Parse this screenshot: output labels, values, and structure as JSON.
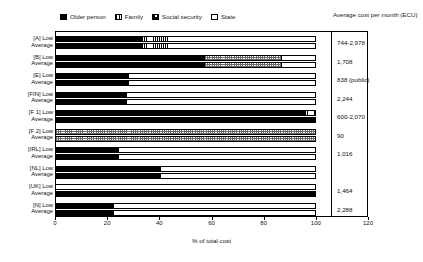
{
  "legend": {
    "items": [
      {
        "label": "Older person",
        "pattern": "solid-black",
        "color": "#000000"
      },
      {
        "label": "Family",
        "pattern": "vertical-stripes",
        "color": "#000000"
      },
      {
        "label": "Social security",
        "pattern": "checkered",
        "color": "#6a6a6a"
      },
      {
        "label": "State",
        "pattern": "white",
        "color": "#ffffff"
      }
    ]
  },
  "right_header": "Average cost per month (ECU)",
  "chart_data": {
    "type": "bar",
    "orientation": "horizontal",
    "stacked": true,
    "title": "",
    "xlabel": "% of total cost",
    "ylabel": "",
    "xlim": [
      0,
      120
    ],
    "xticks": [
      0,
      20,
      40,
      60,
      80,
      100,
      120
    ],
    "grid": false,
    "legend_position": "top",
    "series": [
      {
        "name": "Older person",
        "pattern": "solid-black"
      },
      {
        "name": "Family",
        "pattern": "vertical-stripes"
      },
      {
        "name": "Social security",
        "pattern": "checkered"
      },
      {
        "name": "State",
        "pattern": "white"
      }
    ],
    "groups": [
      {
        "country": "[A]",
        "label_line1": "[A] Low",
        "label_line2": "Average",
        "cost": "744-2,978",
        "bars": [
          {
            "row": "Low",
            "segments": [
              {
                "series": "Older person",
                "value": 33
              },
              {
                "series": "Family",
                "value": 10
              },
              {
                "series": "State",
                "value": 57
              }
            ]
          },
          {
            "row": "Average",
            "segments": [
              {
                "series": "Older person",
                "value": 33
              },
              {
                "series": "Family",
                "value": 10
              },
              {
                "series": "State",
                "value": 57
              }
            ]
          }
        ]
      },
      {
        "country": "[B]",
        "label_line1": "[B] Low",
        "label_line2": "Average",
        "cost": "1,708",
        "bars": [
          {
            "row": "Low",
            "segments": [
              {
                "series": "Older person",
                "value": 57
              },
              {
                "series": "Social security",
                "value": 30
              },
              {
                "series": "State",
                "value": 13
              }
            ]
          },
          {
            "row": "Average",
            "segments": [
              {
                "series": "Older person",
                "value": 57
              },
              {
                "series": "Social security",
                "value": 30
              },
              {
                "series": "State",
                "value": 13
              }
            ]
          }
        ]
      },
      {
        "country": "[E]",
        "label_line1": "[E] Low",
        "label_line2": "Average",
        "cost": "838 (public)",
        "bars": [
          {
            "row": "Low",
            "segments": [
              {
                "series": "Older person",
                "value": 28
              },
              {
                "series": "State",
                "value": 72
              }
            ]
          },
          {
            "row": "Average",
            "segments": [
              {
                "series": "Older person",
                "value": 28
              },
              {
                "series": "State",
                "value": 72
              }
            ]
          }
        ]
      },
      {
        "country": "[FIN]",
        "label_line1": "[FIN] Low",
        "label_line2": "Average",
        "cost": "2,244",
        "bars": [
          {
            "row": "Low",
            "segments": [
              {
                "series": "Older person",
                "value": 27
              },
              {
                "series": "State",
                "value": 73
              }
            ]
          },
          {
            "row": "Average",
            "segments": [
              {
                "series": "Older person",
                "value": 27
              },
              {
                "series": "State",
                "value": 73
              }
            ]
          }
        ]
      },
      {
        "country": "[F 1]",
        "label_line1": "[F 1] Low",
        "label_line2": "Average",
        "cost": "600-2,070",
        "bars": [
          {
            "row": "Low",
            "segments": [
              {
                "series": "Older person",
                "value": 96
              },
              {
                "series": "Family",
                "value": 4
              }
            ]
          },
          {
            "row": "Average",
            "segments": [
              {
                "series": "Older person",
                "value": 100
              }
            ]
          }
        ]
      },
      {
        "country": "[F 2]",
        "label_line1": "[F 2] Low",
        "label_line2": "Average",
        "cost": "90",
        "bars": [
          {
            "row": "Low",
            "segments": [
              {
                "series": "Social security",
                "value": 100
              }
            ]
          },
          {
            "row": "Average",
            "segments": [
              {
                "series": "Social security",
                "value": 100
              }
            ]
          }
        ]
      },
      {
        "country": "[IRL]",
        "label_line1": "[IRL] Low",
        "label_line2": "Average",
        "cost": "1,016",
        "bars": [
          {
            "row": "Low",
            "segments": [
              {
                "series": "Older person",
                "value": 24
              },
              {
                "series": "State",
                "value": 76
              }
            ]
          },
          {
            "row": "Average",
            "segments": [
              {
                "series": "Older person",
                "value": 24
              },
              {
                "series": "State",
                "value": 76
              }
            ]
          }
        ]
      },
      {
        "country": "[NL]",
        "label_line1": "[NL] Low",
        "label_line2": "Average",
        "cost": "",
        "bars": [
          {
            "row": "Low",
            "segments": [
              {
                "series": "Older person",
                "value": 40
              },
              {
                "series": "State",
                "value": 60
              }
            ]
          },
          {
            "row": "Average",
            "segments": [
              {
                "series": "Older person",
                "value": 40
              },
              {
                "series": "State",
                "value": 60
              }
            ]
          }
        ]
      },
      {
        "country": "[UK]",
        "label_line1": "[UK] Low",
        "label_line2": "Average",
        "cost": "1,464",
        "bars": [
          {
            "row": "Low",
            "segments": [
              {
                "series": "State",
                "value": 100
              }
            ]
          },
          {
            "row": "Average",
            "segments": [
              {
                "series": "Older person",
                "value": 100
              }
            ]
          }
        ]
      },
      {
        "country": "[N]",
        "label_line1": "[N] Low",
        "label_line2": "Average",
        "cost": "2,288",
        "bars": [
          {
            "row": "Low",
            "segments": [
              {
                "series": "Older person",
                "value": 22
              },
              {
                "series": "State",
                "value": 78
              }
            ]
          },
          {
            "row": "Average",
            "segments": [
              {
                "series": "Older person",
                "value": 22
              },
              {
                "series": "State",
                "value": 78
              }
            ]
          }
        ]
      }
    ]
  }
}
